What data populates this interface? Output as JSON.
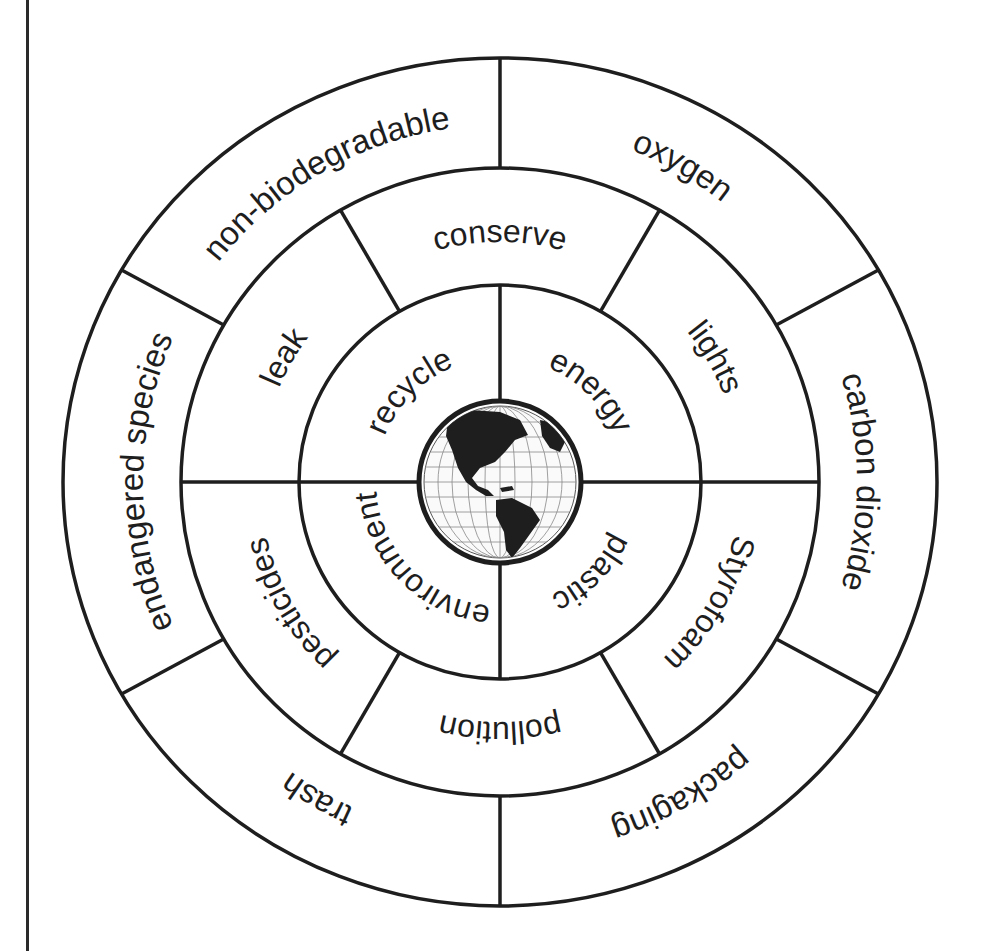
{
  "diagram": {
    "title": "",
    "center_icon": "globe-icon",
    "center_icon_description": "Globe showing North and South America with latitude/longitude grid",
    "stroke_color": "#1e1e1e",
    "background_color": "#ffffff",
    "geometry": {
      "cx": 500,
      "cy": 482,
      "outer": {
        "rx": 437,
        "ry": 424
      },
      "middle": {
        "rx": 319,
        "ry": 314
      },
      "inner": {
        "rx": 201,
        "ry": 197
      },
      "globe": {
        "r": 80
      }
    },
    "rings": {
      "outer": {
        "text_radius": 357,
        "dividers_deg": [
          0,
          60,
          120,
          180,
          240,
          300
        ],
        "segments": [
          {
            "label": "non-biodegradable",
            "mid_deg": -30
          },
          {
            "label": "oxygen",
            "mid_deg": 30
          },
          {
            "label": "carbon dioxide",
            "mid_deg": 90
          },
          {
            "label": "packaging",
            "mid_deg": 150
          },
          {
            "label": "trash",
            "mid_deg": 210
          },
          {
            "label": "endangered species",
            "mid_deg": 270
          }
        ]
      },
      "middle": {
        "text_radius": 240,
        "dividers_deg": [
          30,
          90,
          150,
          210,
          270,
          330
        ],
        "segments": [
          {
            "label": "conserve",
            "mid_deg": 0
          },
          {
            "label": "lights",
            "mid_deg": 60
          },
          {
            "label": "Styrofoam",
            "mid_deg": 120
          },
          {
            "label": "pollution",
            "mid_deg": 180
          },
          {
            "label": "pesticides",
            "mid_deg": 240
          },
          {
            "label": "leak",
            "mid_deg": 300
          }
        ]
      },
      "inner": {
        "text_radius": 124,
        "dividers_deg": [
          0,
          90,
          180,
          270
        ],
        "segments": [
          {
            "label": "energy",
            "mid_deg": 45
          },
          {
            "label": "plastic",
            "mid_deg": 135
          },
          {
            "label": "environment",
            "mid_deg": 225
          },
          {
            "label": "recycle",
            "mid_deg": 315
          }
        ]
      }
    }
  }
}
